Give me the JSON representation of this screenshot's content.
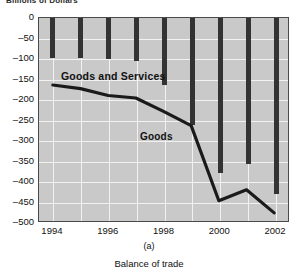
{
  "chart_data": {
    "type": "bar",
    "title": "",
    "ylabel": "Billions of Dollars",
    "xlabel": "",
    "caption_panel": "(a)",
    "caption_main": "Balance of trade",
    "ylim": [
      -500,
      0
    ],
    "ytick_values": [
      0,
      -50,
      -100,
      -150,
      -200,
      -250,
      -300,
      -350,
      -400,
      -450,
      -500
    ],
    "ytick_labels": [
      "0",
      "–50",
      "–100",
      "–150",
      "–200",
      "–250",
      "–300",
      "–350",
      "–400",
      "–450",
      "–500"
    ],
    "xlim": [
      1993.5,
      2002.5
    ],
    "x": [
      1994,
      1995,
      1996,
      1997,
      1998,
      1999,
      2000,
      2001,
      2002
    ],
    "xtick_values": [
      1994,
      1996,
      1998,
      2000,
      2002
    ],
    "xtick_labels": [
      "1994",
      "1996",
      "1998",
      "2000",
      "2002"
    ],
    "grid": true,
    "legend": "in-plot annotations",
    "plot_background": "#c9c9c9",
    "gridline_color": "#f2f2f2",
    "series": [
      {
        "name": "Goods and Services",
        "render": "bar",
        "color": "#333333",
        "label_text": "Goods and Services",
        "values": [
          -98,
          -98,
          -100,
          -105,
          -163,
          -260,
          -378,
          -355,
          -430
        ]
      },
      {
        "name": "Goods",
        "render": "line",
        "color": "#1a1a1a",
        "label_text": "Goods",
        "values": [
          -165,
          -174,
          -191,
          -197,
          -230,
          -265,
          -450,
          -423,
          -480
        ]
      }
    ]
  }
}
